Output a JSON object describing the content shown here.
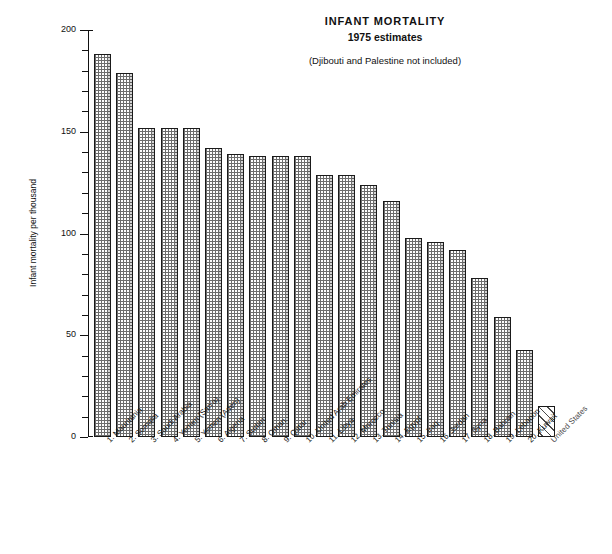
{
  "chart_data": {
    "type": "bar",
    "title": "INFANT MORTALITY",
    "subtitle": "1975 estimates",
    "note": "(Djibouti and Palestine not included)",
    "xlabel": "",
    "ylabel": "Infant mortality per thousand",
    "ylim": [
      0,
      200
    ],
    "yticks": [
      0,
      50,
      100,
      150,
      200
    ],
    "ytick_labels": [
      "0",
      "50",
      "100",
      "150",
      "200"
    ],
    "minor_tick_step": 10,
    "grid": false,
    "legend": "none",
    "categories": [
      "1.  Mauritania",
      "2.  Somalia",
      "3.  Saudi Arabia",
      "4.  Yemen (San'a)",
      "5.  Yemen (Aden)",
      "6.  Algeria",
      "7.  Sudan",
      "8.  Oman",
      "9.  Qatar",
      "10.  United Arab Emirates",
      "11.  Libya",
      "12.  Morocco",
      "13.  Tunisia",
      "14.  Egypt",
      "15.  Iraq",
      "16.  Jordan",
      "17.  Syria",
      "18.  Bahrain",
      "19.  Lebanon",
      "20.  Kuwait",
      "United States"
    ],
    "values": [
      188,
      179,
      152,
      152,
      152,
      142,
      139,
      138,
      138,
      138,
      129,
      129,
      124,
      116,
      98,
      96,
      92,
      78,
      59,
      43,
      15
    ],
    "styles": [
      "dotted",
      "dotted",
      "dotted",
      "dotted",
      "dotted",
      "dotted",
      "dotted",
      "dotted",
      "dotted",
      "dotted",
      "dotted",
      "dotted",
      "dotted",
      "dotted",
      "dotted",
      "dotted",
      "dotted",
      "dotted",
      "dotted",
      "dotted",
      "hatched"
    ],
    "colors": {
      "axis": "#111111",
      "bar_outline": "#1a1a1a",
      "bar_fill": "#fefefe",
      "bar_pattern": "#6d6d6d",
      "background": "#ffffff"
    }
  }
}
